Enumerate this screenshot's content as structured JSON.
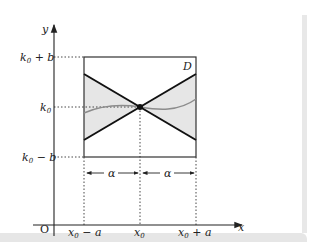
{
  "diagram": {
    "axes": {
      "x_label": "x",
      "y_label": "y",
      "origin_label": "O"
    },
    "y_ticks": [
      {
        "base": "k",
        "sub": "0",
        "rest": " + b"
      },
      {
        "base": "k",
        "sub": "0",
        "rest": ""
      },
      {
        "base": "k",
        "sub": "0",
        "rest": " − b"
      }
    ],
    "x_ticks": [
      {
        "base": "x",
        "sub": "0",
        "rest": " − a"
      },
      {
        "base": "x",
        "sub": "0",
        "rest": ""
      },
      {
        "base": "x",
        "sub": "0",
        "rest": " + a"
      }
    ],
    "region_label": "D",
    "interval_labels": [
      "α",
      "α"
    ],
    "colors": {
      "shade": "#e6e6e6",
      "curve": "#8c8c8c",
      "lines": "#111111",
      "axis": "#222222"
    }
  }
}
